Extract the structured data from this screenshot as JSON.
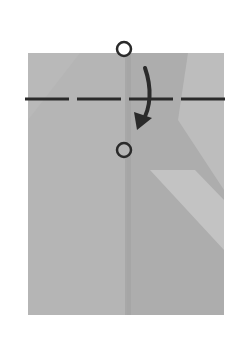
{
  "diagram": {
    "type": "origami-step",
    "colors": {
      "paper": "#b4b4b4",
      "paper_light": "#c2c2c2",
      "paper_dark": "#a8a8a8",
      "line": "#2a2a2a",
      "background": "#ffffff"
    },
    "elements": {
      "fold_line": "valley-fold-dashed-line",
      "arrow": "fold-direction-arrow",
      "markers": [
        "reference-point-top",
        "reference-point-bottom"
      ]
    }
  }
}
